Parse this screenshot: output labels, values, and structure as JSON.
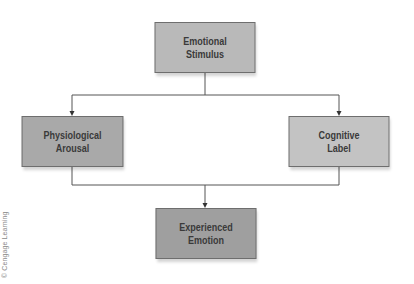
{
  "diagram": {
    "type": "flowchart",
    "nodes": [
      {
        "id": "stimulus",
        "label": "Emotional\nStimulus"
      },
      {
        "id": "arousal",
        "label": "Physiological\nArousal"
      },
      {
        "id": "label",
        "label": "Cognitive\nLabel"
      },
      {
        "id": "emotion",
        "label": "Experienced\nEmotion"
      }
    ],
    "edges": [
      {
        "from": "stimulus",
        "to": "arousal"
      },
      {
        "from": "stimulus",
        "to": "label"
      },
      {
        "from": "arousal",
        "to": "emotion"
      },
      {
        "from": "label",
        "to": "emotion"
      }
    ],
    "colors": {
      "stimulus_fill": "#b9b9b9",
      "arousal_fill": "#a9a9a9",
      "label_fill": "#c3c3c3",
      "emotion_fill": "#9f9f9f",
      "border": "#6e6e6e",
      "line": "#555555",
      "text": "#3a3a3a"
    }
  },
  "credit": "© Cengage Learning"
}
